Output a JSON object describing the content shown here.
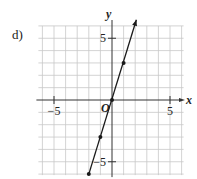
{
  "problem": {
    "label": "d)"
  },
  "chart_data": {
    "type": "line",
    "title": "",
    "xlabel": "x",
    "ylabel": "y",
    "origin_label": "O",
    "xlim": [
      -6,
      6
    ],
    "ylim": [
      -6,
      6
    ],
    "grid": true,
    "x_ticks": [
      {
        "value": -5,
        "label": "-5"
      },
      {
        "value": 5,
        "label": "5"
      }
    ],
    "y_ticks": [
      {
        "value": 5,
        "label": "5"
      },
      {
        "value": -5,
        "label": "-5"
      }
    ],
    "series": [
      {
        "name": "y = 3x",
        "equation": "y = 3x",
        "points": [
          {
            "x": -2,
            "y": -6
          },
          {
            "x": -1,
            "y": -3
          },
          {
            "x": 0,
            "y": 0
          },
          {
            "x": 1,
            "y": 3
          }
        ],
        "line_start": {
          "x": -2,
          "y": -6
        },
        "line_end_arrow": {
          "x": 2.1,
          "y": 6.5
        }
      }
    ],
    "colors": {
      "grid": "#c8c8c8",
      "axis": "#333333",
      "line": "#1a1a1a"
    }
  }
}
